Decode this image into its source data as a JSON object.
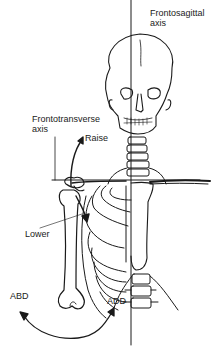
{
  "labels": {
    "frontosagittal_line1": "Frontosagittal",
    "frontosagittal_line2": "axis",
    "frontotransverse_line1": "Frontotransverse",
    "frontotransverse_line2": "axis",
    "raise": "Raise",
    "lower": "Lower",
    "abd": "ABD",
    "add": "ADD"
  },
  "colors": {
    "ink": "#1a1a1a",
    "background": "#ffffff"
  }
}
